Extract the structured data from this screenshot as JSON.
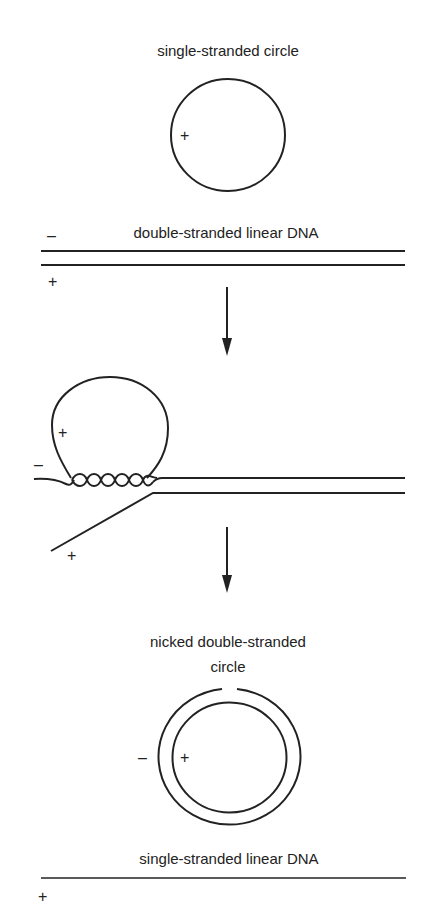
{
  "diagram": {
    "title_single_circle": "single-stranded circle",
    "title_ds_linear": "double-stranded linear DNA",
    "title_nicked_line1": "nicked double-stranded",
    "title_nicked_line2": "circle",
    "title_ss_linear": "single-stranded linear DNA",
    "signs": {
      "plus": "+",
      "minus": "–"
    },
    "stroke_color": "#222222",
    "background_color": "#ffffff"
  }
}
